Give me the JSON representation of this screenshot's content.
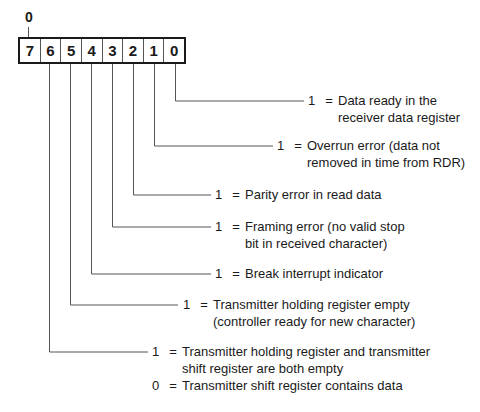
{
  "diagram": {
    "top_label": "0",
    "register": {
      "bits": [
        "7",
        "6",
        "5",
        "4",
        "3",
        "2",
        "1",
        "0"
      ]
    },
    "descriptions": [
      {
        "bit": "0",
        "entries": [
          {
            "value": "1",
            "eq": "=",
            "lines": [
              "Data ready in the",
              "receiver data register"
            ]
          }
        ]
      },
      {
        "bit": "1",
        "entries": [
          {
            "value": "1",
            "eq": "=",
            "lines": [
              "Overrun error (data not",
              "removed in time from RDR)"
            ]
          }
        ]
      },
      {
        "bit": "2",
        "entries": [
          {
            "value": "1",
            "eq": "=",
            "lines": [
              "Parity error in read data"
            ]
          }
        ]
      },
      {
        "bit": "3",
        "entries": [
          {
            "value": "1",
            "eq": "=",
            "lines": [
              "Framing error (no valid stop",
              "bit in received character)"
            ]
          }
        ]
      },
      {
        "bit": "4",
        "entries": [
          {
            "value": "1",
            "eq": "=",
            "lines": [
              "Break interrupt indicator"
            ]
          }
        ]
      },
      {
        "bit": "5",
        "entries": [
          {
            "value": "1",
            "eq": "=",
            "lines": [
              "Transmitter holding register empty",
              "(controller ready for new character)"
            ]
          }
        ]
      },
      {
        "bit": "6",
        "entries": [
          {
            "value": "1",
            "eq": "=",
            "lines": [
              "Transmitter holding register and transmitter",
              "shift register are both empty"
            ]
          },
          {
            "value": "0",
            "eq": "=",
            "lines": [
              "Transmitter shift register contains data"
            ]
          }
        ]
      }
    ]
  }
}
